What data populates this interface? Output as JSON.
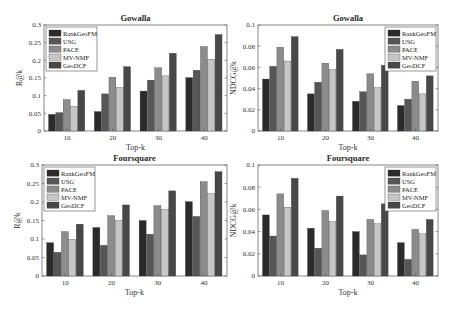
{
  "figure": {
    "background": "#ffffff",
    "series_colors": {
      "RankGeoFM": "#2b2b2b",
      "USG": "#565656",
      "PACE": "#8c8c8c",
      "MV-NMF": "#c6c6c6",
      "GeoDCF": "#484848"
    }
  },
  "chart_data": [
    {
      "type": "bar",
      "title": "Gowalla",
      "xlabel": "Top-k",
      "ylabel": "R@k",
      "categories": [
        "10",
        "20",
        "30",
        "40"
      ],
      "ylim": [
        0,
        0.3
      ],
      "yticks": [
        "0",
        "0.05",
        "0.1",
        "0.15",
        "0.2",
        "0.25",
        "0.3"
      ],
      "legend_position": "upper-left",
      "grid": false,
      "series": [
        {
          "name": "RankGeoFM",
          "values": [
            0.047,
            0.055,
            0.113,
            0.151
          ]
        },
        {
          "name": "USG",
          "values": [
            0.052,
            0.105,
            0.144,
            0.172
          ]
        },
        {
          "name": "PACE",
          "values": [
            0.089,
            0.152,
            0.179,
            0.239
          ]
        },
        {
          "name": "MV-NMF",
          "values": [
            0.07,
            0.123,
            0.156,
            0.203
          ]
        },
        {
          "name": "GeoDCF",
          "values": [
            0.115,
            0.182,
            0.22,
            0.273
          ]
        }
      ]
    },
    {
      "type": "bar",
      "title": "Gowalla",
      "xlabel": "Top-k",
      "ylabel": "NDCG@k",
      "categories": [
        "10",
        "20",
        "30",
        "40"
      ],
      "ylim": [
        0,
        0.1
      ],
      "yticks": [
        "0",
        "0.02",
        "0.04",
        "0.06",
        "0.08",
        "0.1"
      ],
      "legend_position": "upper-right",
      "grid": false,
      "series": [
        {
          "name": "RankGeoFM",
          "values": [
            0.049,
            0.035,
            0.028,
            0.024
          ]
        },
        {
          "name": "USG",
          "values": [
            0.061,
            0.046,
            0.037,
            0.03
          ]
        },
        {
          "name": "PACE",
          "values": [
            0.079,
            0.064,
            0.054,
            0.047
          ]
        },
        {
          "name": "MV-NMF",
          "values": [
            0.066,
            0.058,
            0.041,
            0.035
          ]
        },
        {
          "name": "GeoDCF",
          "values": [
            0.089,
            0.077,
            0.062,
            0.052
          ]
        }
      ]
    },
    {
      "type": "bar",
      "title": "Foursquare",
      "xlabel": "Top-k",
      "ylabel": "R@k",
      "categories": [
        "10",
        "20",
        "30",
        "40"
      ],
      "ylim": [
        0,
        0.3
      ],
      "yticks": [
        "0",
        "0.05",
        "0.1",
        "0.15",
        "0.2",
        "0.25",
        "0.3"
      ],
      "legend_position": "upper-left",
      "grid": false,
      "series": [
        {
          "name": "RankGeoFM",
          "values": [
            0.09,
            0.131,
            0.15,
            0.201
          ]
        },
        {
          "name": "USG",
          "values": [
            0.064,
            0.083,
            0.113,
            0.161
          ]
        },
        {
          "name": "PACE",
          "values": [
            0.12,
            0.163,
            0.19,
            0.255
          ]
        },
        {
          "name": "MV-NMF",
          "values": [
            0.099,
            0.15,
            0.18,
            0.223
          ]
        },
        {
          "name": "GeoDCF",
          "values": [
            0.14,
            0.192,
            0.23,
            0.282
          ]
        }
      ]
    },
    {
      "type": "bar",
      "title": "Foursquare",
      "xlabel": "Top-k",
      "ylabel": "NDCG@k",
      "categories": [
        "10",
        "20",
        "30",
        "40"
      ],
      "ylim": [
        0,
        0.1
      ],
      "yticks": [
        "0",
        "0.02",
        "0.04",
        "0.06",
        "0.08",
        "0.1"
      ],
      "legend_position": "upper-right",
      "grid": false,
      "series": [
        {
          "name": "RankGeoFM",
          "values": [
            0.055,
            0.043,
            0.04,
            0.03
          ]
        },
        {
          "name": "USG",
          "values": [
            0.036,
            0.025,
            0.019,
            0.015
          ]
        },
        {
          "name": "PACE",
          "values": [
            0.074,
            0.059,
            0.051,
            0.042
          ]
        },
        {
          "name": "MV-NMF",
          "values": [
            0.062,
            0.049,
            0.047,
            0.038
          ]
        },
        {
          "name": "GeoDCF",
          "values": [
            0.088,
            0.072,
            0.065,
            0.051
          ]
        }
      ]
    }
  ]
}
